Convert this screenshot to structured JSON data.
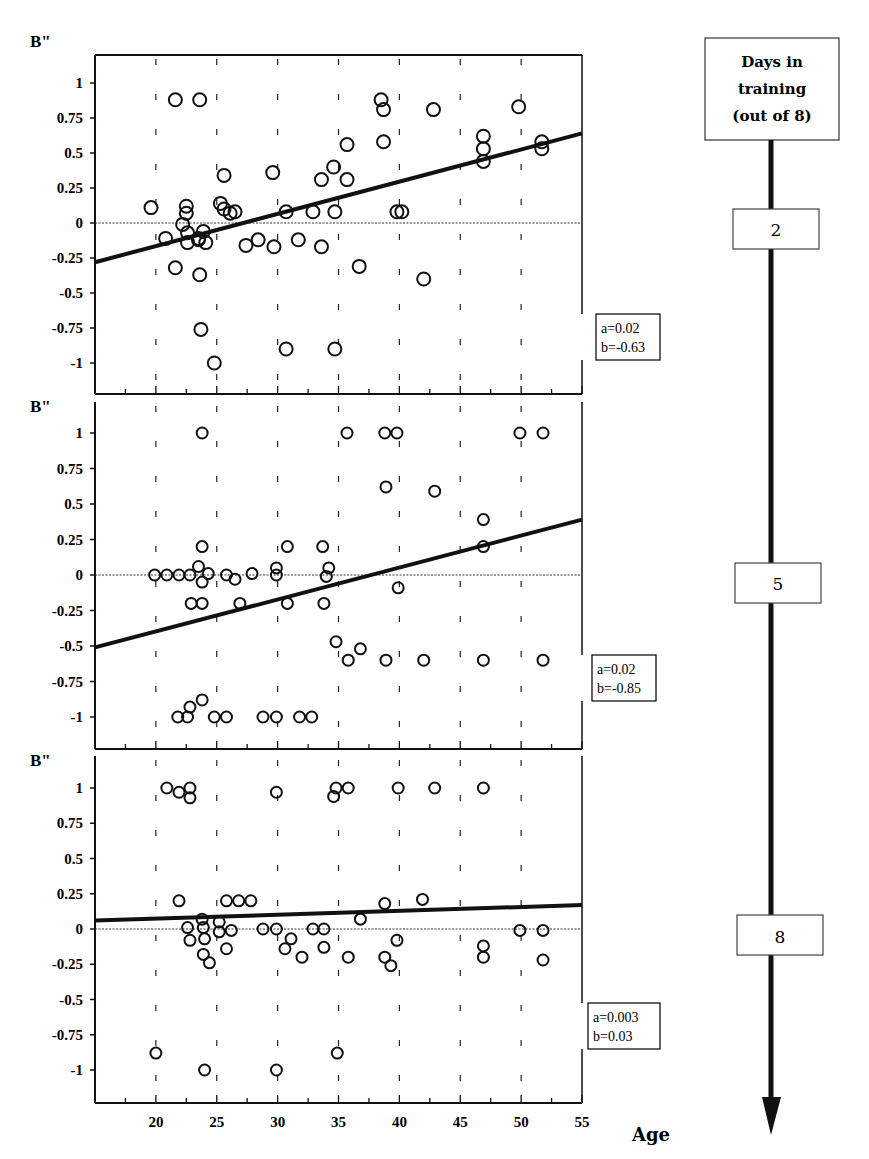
{
  "figure": {
    "x_axis_label": "Age",
    "x_ticks": [
      "20",
      "25",
      "30",
      "35",
      "40",
      "45",
      "50",
      "55"
    ],
    "timeline": {
      "header": [
        "Days in",
        "training",
        "(out of 8)"
      ],
      "markers": [
        "2",
        "5",
        "8"
      ]
    }
  },
  "chart_data": [
    {
      "type": "scatter",
      "title": "",
      "panel_day": "2",
      "xlabel": "Age",
      "ylabel": "B\"",
      "xlim": [
        15,
        55
      ],
      "ylim": [
        -1.2,
        1.2
      ],
      "y_ticks": [
        "1",
        "0.75",
        "0.5",
        "0.25",
        "0",
        "-0.25",
        "-0.5",
        "-0.75",
        "-1"
      ],
      "grid": "dashed vertical at 20..50",
      "regression": {
        "a": "a=0.02",
        "b": "b=-0.63",
        "slope": 0.02,
        "intercept": -0.63,
        "line_from": [
          15,
          -0.28
        ],
        "line_to": [
          55,
          0.64
        ]
      },
      "points": [
        [
          19.6,
          0.11
        ],
        [
          20.8,
          -0.11
        ],
        [
          21.6,
          0.88
        ],
        [
          21.6,
          -0.32
        ],
        [
          22.2,
          -0.01
        ],
        [
          22.5,
          0.12
        ],
        [
          22.5,
          0.07
        ],
        [
          22.6,
          -0.07
        ],
        [
          22.6,
          -0.14
        ],
        [
          23.5,
          -0.12
        ],
        [
          23.5,
          -0.11
        ],
        [
          23.6,
          0.88
        ],
        [
          23.6,
          -0.37
        ],
        [
          23.7,
          -0.76
        ],
        [
          23.9,
          -0.06
        ],
        [
          24.1,
          -0.14
        ],
        [
          24.8,
          -1.0
        ],
        [
          25.3,
          0.14
        ],
        [
          25.6,
          0.34
        ],
        [
          25.6,
          0.1
        ],
        [
          26.1,
          0.07
        ],
        [
          26.5,
          0.08
        ],
        [
          27.4,
          -0.16
        ],
        [
          28.4,
          -0.12
        ],
        [
          29.6,
          0.36
        ],
        [
          29.7,
          -0.17
        ],
        [
          30.7,
          0.08
        ],
        [
          30.7,
          -0.9
        ],
        [
          31.7,
          -0.12
        ],
        [
          32.9,
          0.08
        ],
        [
          33.6,
          0.31
        ],
        [
          33.6,
          -0.17
        ],
        [
          34.6,
          0.4
        ],
        [
          34.7,
          0.08
        ],
        [
          34.7,
          -0.9
        ],
        [
          35.7,
          0.56
        ],
        [
          35.7,
          0.31
        ],
        [
          36.7,
          -0.31
        ],
        [
          38.5,
          0.88
        ],
        [
          38.7,
          0.81
        ],
        [
          38.7,
          0.58
        ],
        [
          39.8,
          0.08
        ],
        [
          40.2,
          0.08
        ],
        [
          42.0,
          -0.4
        ],
        [
          42.8,
          0.81
        ],
        [
          46.9,
          0.62
        ],
        [
          46.9,
          0.53
        ],
        [
          46.9,
          0.44
        ],
        [
          49.8,
          0.83
        ],
        [
          51.7,
          0.58
        ],
        [
          51.7,
          0.53
        ]
      ]
    },
    {
      "type": "scatter",
      "title": "",
      "panel_day": "5",
      "xlabel": "Age",
      "ylabel": "B\"",
      "xlim": [
        15,
        55
      ],
      "ylim": [
        -1.22,
        1.2
      ],
      "y_ticks": [
        "1",
        "0.75",
        "0.5",
        "0.25",
        "0",
        "-0.25",
        "-0.5",
        "-0.75",
        "-1"
      ],
      "grid": "dashed vertical at 20..50",
      "regression": {
        "a": "a=0.02",
        "b": "b=-0.85",
        "slope": 0.02,
        "intercept": -0.85,
        "line_from": [
          15,
          -0.51
        ],
        "line_to": [
          55,
          0.39
        ]
      },
      "points": [
        [
          19.9,
          0.0
        ],
        [
          20.9,
          0.0
        ],
        [
          21.9,
          0.0
        ],
        [
          22.8,
          0.0
        ],
        [
          23.5,
          0.06
        ],
        [
          23.8,
          0.2
        ],
        [
          23.8,
          -0.05
        ],
        [
          23.8,
          1.0
        ],
        [
          24.3,
          0.01
        ],
        [
          22.9,
          -0.2
        ],
        [
          23.8,
          -0.2
        ],
        [
          25.8,
          0.0
        ],
        [
          26.5,
          -0.03
        ],
        [
          26.9,
          -0.2
        ],
        [
          27.9,
          0.01
        ],
        [
          29.9,
          0.05
        ],
        [
          29.9,
          0.0
        ],
        [
          30.8,
          0.2
        ],
        [
          30.8,
          -0.2
        ],
        [
          33.7,
          0.2
        ],
        [
          33.8,
          -0.2
        ],
        [
          34.2,
          0.05
        ],
        [
          34.0,
          -0.01
        ],
        [
          34.8,
          -0.47
        ],
        [
          35.7,
          1.0
        ],
        [
          35.8,
          -0.6
        ],
        [
          36.8,
          -0.52
        ],
        [
          38.8,
          1.0
        ],
        [
          38.9,
          0.62
        ],
        [
          38.9,
          -0.6
        ],
        [
          39.8,
          1.0
        ],
        [
          39.9,
          -0.09
        ],
        [
          42.0,
          -0.6
        ],
        [
          42.9,
          0.59
        ],
        [
          46.9,
          0.39
        ],
        [
          46.9,
          0.2
        ],
        [
          46.9,
          -0.6
        ],
        [
          49.9,
          1.0
        ],
        [
          51.8,
          1.0
        ],
        [
          51.8,
          -0.6
        ],
        [
          21.8,
          -1.0
        ],
        [
          22.6,
          -1.0
        ],
        [
          22.8,
          -0.93
        ],
        [
          23.8,
          -0.88
        ],
        [
          24.8,
          -1.0
        ],
        [
          25.8,
          -1.0
        ],
        [
          28.8,
          -1.0
        ],
        [
          29.9,
          -1.0
        ],
        [
          31.8,
          -1.0
        ],
        [
          32.8,
          -1.0
        ]
      ]
    },
    {
      "type": "scatter",
      "title": "",
      "panel_day": "8",
      "xlabel": "Age",
      "ylabel": "B\"",
      "xlim": [
        15,
        55
      ],
      "ylim": [
        -1.22,
        1.2
      ],
      "x_ticks": [
        "20",
        "25",
        "30",
        "35",
        "40",
        "45",
        "50",
        "55"
      ],
      "y_ticks": [
        "1",
        "0.75",
        "0.5",
        "0.25",
        "0",
        "-0.25",
        "-0.5",
        "-0.75",
        "-1"
      ],
      "grid": "dashed vertical at 20..50",
      "regression": {
        "a": "a=0.003",
        "b": "b=0.03",
        "slope": 0.003,
        "intercept": 0.03,
        "line_from": [
          15,
          0.06
        ],
        "line_to": [
          55,
          0.17
        ]
      },
      "points": [
        [
          20.9,
          1.0
        ],
        [
          21.9,
          0.97
        ],
        [
          22.8,
          1.0
        ],
        [
          22.8,
          0.93
        ],
        [
          29.9,
          0.97
        ],
        [
          34.8,
          1.0
        ],
        [
          34.6,
          0.94
        ],
        [
          35.8,
          1.0
        ],
        [
          39.9,
          1.0
        ],
        [
          42.9,
          1.0
        ],
        [
          46.9,
          1.0
        ],
        [
          21.9,
          0.2
        ],
        [
          25.8,
          0.2
        ],
        [
          26.8,
          0.2
        ],
        [
          27.8,
          0.2
        ],
        [
          23.8,
          0.07
        ],
        [
          25.2,
          0.05
        ],
        [
          22.6,
          0.01
        ],
        [
          23.9,
          0.01
        ],
        [
          25.2,
          -0.02
        ],
        [
          26.2,
          -0.01
        ],
        [
          28.8,
          0.0
        ],
        [
          29.9,
          0.0
        ],
        [
          32.9,
          0.0
        ],
        [
          33.8,
          0.0
        ],
        [
          49.9,
          -0.01
        ],
        [
          51.8,
          -0.01
        ],
        [
          22.8,
          -0.08
        ],
        [
          24.0,
          -0.07
        ],
        [
          23.9,
          -0.18
        ],
        [
          24.4,
          -0.24
        ],
        [
          25.8,
          -0.14
        ],
        [
          30.6,
          -0.14
        ],
        [
          31.1,
          -0.07
        ],
        [
          32.0,
          -0.2
        ],
        [
          33.8,
          -0.13
        ],
        [
          35.8,
          -0.2
        ],
        [
          36.8,
          0.07
        ],
        [
          38.8,
          0.18
        ],
        [
          38.8,
          -0.2
        ],
        [
          39.3,
          -0.26
        ],
        [
          39.8,
          -0.08
        ],
        [
          41.9,
          0.21
        ],
        [
          46.9,
          -0.12
        ],
        [
          46.9,
          -0.2
        ],
        [
          51.8,
          -0.22
        ],
        [
          20.0,
          -0.88
        ],
        [
          24.0,
          -1.0
        ],
        [
          29.9,
          -1.0
        ],
        [
          34.9,
          -0.88
        ]
      ]
    }
  ]
}
